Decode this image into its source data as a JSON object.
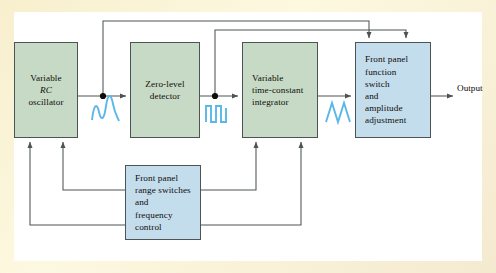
{
  "diagram": {
    "frame_color": "#f6efcf",
    "background_color": "#ffffff",
    "line_color": "#4c5456",
    "wave_color": "#5bb7e8",
    "blocks": [
      {
        "id": "rc-oscillator",
        "lines": [
          "Variable",
          "RC",
          "oscillator"
        ],
        "italic_lines": [
          1
        ],
        "fill": "#c6dac6",
        "x": 14,
        "y": 42,
        "w": 64,
        "h": 96,
        "align": "center"
      },
      {
        "id": "zero-level-detector",
        "lines": [
          "Zero-level",
          "detector"
        ],
        "italic_lines": [],
        "fill": "#c6dac6",
        "x": 130,
        "y": 42,
        "w": 70,
        "h": 96,
        "align": "center"
      },
      {
        "id": "time-constant-integrator",
        "lines": [
          "Variable",
          "time-constant",
          "integrator"
        ],
        "italic_lines": [],
        "fill": "#c6dac6",
        "x": 242,
        "y": 42,
        "w": 76,
        "h": 96,
        "align": "left"
      },
      {
        "id": "front-panel-function-switch",
        "lines": [
          "Front panel",
          "function",
          "switch",
          "and",
          "amplitude",
          "adjustment"
        ],
        "italic_lines": [],
        "fill": "#c4dded",
        "x": 355,
        "y": 42,
        "w": 76,
        "h": 96,
        "align": "left"
      },
      {
        "id": "front-panel-range-switches",
        "lines": [
          "Front panel",
          "range switches",
          "and",
          "frequency",
          "control"
        ],
        "italic_lines": [],
        "fill": "#c4dded",
        "x": 125,
        "y": 165,
        "w": 76,
        "h": 75,
        "align": "left"
      }
    ],
    "waveforms": [
      {
        "id": "sine-waveform",
        "type": "sine",
        "x": 92,
        "y": 100
      },
      {
        "id": "square-waveform",
        "type": "square",
        "x": 205,
        "y": 100
      },
      {
        "id": "triangle-waveform",
        "type": "triangle",
        "x": 325,
        "y": 100
      }
    ],
    "junctions": [
      {
        "id": "sine-tap",
        "x": 103,
        "y": 96
      },
      {
        "id": "square-tap",
        "x": 215,
        "y": 96
      }
    ],
    "output_label": "Output"
  }
}
